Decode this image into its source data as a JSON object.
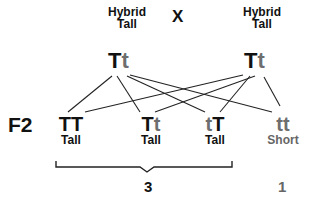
{
  "parents": {
    "left": {
      "line1": "Hybrid",
      "line2": "Tall",
      "allele1": "T",
      "allele2": "t"
    },
    "cross_symbol": "X",
    "right": {
      "line1": "Hybrid",
      "line2": "Tall",
      "allele1": "T",
      "allele2": "t"
    }
  },
  "generation_label": "F2",
  "offspring": [
    {
      "allele1": "T",
      "allele2": "T",
      "phenotype": "Tall"
    },
    {
      "allele1": "T",
      "allele2": "t",
      "phenotype": "Tall"
    },
    {
      "allele1": "t",
      "allele2": "T",
      "phenotype": "Tall"
    },
    {
      "allele1": "t",
      "allele2": "t",
      "phenotype": "Short"
    }
  ],
  "ratio": {
    "dominant_count": "3",
    "recessive_count": "1"
  },
  "colors": {
    "dominant": "#111111",
    "recessive": "#6e6e6e",
    "lines": "#222222"
  }
}
